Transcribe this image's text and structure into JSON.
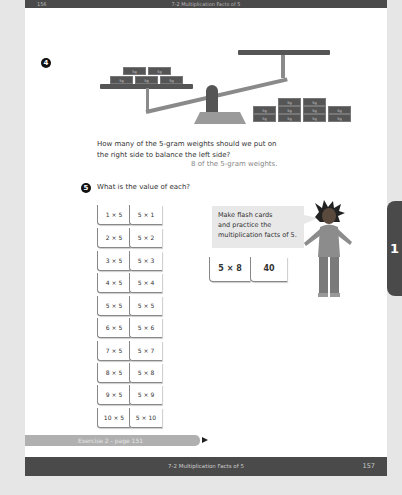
{
  "header": {
    "page_number": "156",
    "title": "7-2 Multiplication Facts of 5"
  },
  "footer": {
    "title": "7-2 Multiplication Facts of 5",
    "page_number": "157"
  },
  "side_tab": {
    "label": "1"
  },
  "question4": {
    "number": "4",
    "weight_label": "5g",
    "left_weights_count": 5,
    "right_weights_count": 10,
    "text_line1": "How many of the 5-gram weights should we put on",
    "text_line2": "the right side to balance the left side?",
    "answer": "8 of the 5-gram weights."
  },
  "question5": {
    "number": "5",
    "text": "What is the value of each?",
    "cards": [
      {
        "left": "1 × 5",
        "right": "5 × 1"
      },
      {
        "left": "2 × 5",
        "right": "5 × 2"
      },
      {
        "left": "3 × 5",
        "right": "5 × 3"
      },
      {
        "left": "4 × 5",
        "right": "5 × 4"
      },
      {
        "left": "5 × 5",
        "right": "5 × 5"
      },
      {
        "left": "6 × 5",
        "right": "5 × 6"
      },
      {
        "left": "7 × 5",
        "right": "5 × 7"
      },
      {
        "left": "8 × 5",
        "right": "5 × 8"
      },
      {
        "left": "9 × 5",
        "right": "5 × 9"
      },
      {
        "left": "10 × 5",
        "right": "5 × 10"
      }
    ],
    "speech_line1": "Make flash cards",
    "speech_line2": "and practice the",
    "speech_line3": "multiplication facts of 5.",
    "example_front": "5 × 8",
    "example_back": "40"
  },
  "exercise_link": {
    "label": "Exercise 2 - page 151"
  },
  "colors": {
    "dark_bar": "#4a4a4a",
    "weight": "#555555",
    "exercise_bar": "#b0b0b0"
  }
}
